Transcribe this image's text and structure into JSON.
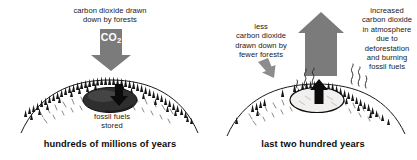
{
  "figure": {
    "title": "Carbon dioxide: forests vs. deforestation and fossil fuel burning",
    "colors": {
      "arrow_gray": "#7b7b7b",
      "ink_black": "#111111",
      "label_white": "#ffffff",
      "background": "#ffffff"
    }
  },
  "panels": [
    {
      "id": "left",
      "heading": "carbon dioxide drawn\ndown by forests",
      "arrow": {
        "icon": "thick-down-arrow-icon",
        "direction": "down",
        "label": "CO",
        "label_subscript": "2",
        "color": "#7b7b7b"
      },
      "deposit_label": "fossil fuels\nstored",
      "deposit_arrow": {
        "icon": "down-arrow-icon",
        "direction": "down",
        "color": "#111111"
      },
      "caption": "hundreds of millions of years",
      "scene": {
        "tree_count": 58,
        "tree_density": "dense",
        "deposit_fill": "dark",
        "smoke": false
      }
    },
    {
      "id": "right",
      "heading_left": "less\ncarbon dioxide\ndrawn down by\nfewer forests",
      "heading_right": "increased\ncarbon dioxide\nin atmosphere\ndue to\ndeforestation\nand burning\nfossil fuels",
      "arrow": {
        "icon": "thick-up-arrow-icon",
        "direction": "up",
        "label": "CO",
        "label_subscript": "2",
        "color": "#7b7b7b"
      },
      "small_arrow": {
        "icon": "small-down-arrow-icon",
        "direction": "down",
        "color": "#8c8c8c"
      },
      "deposit_arrow": {
        "icon": "up-arrow-icon",
        "direction": "up",
        "color": "#111111"
      },
      "caption": "last two hundred years",
      "scene": {
        "tree_count": 33,
        "tree_density": "sparse",
        "deposit_fill": "light",
        "smoke": true
      }
    }
  ]
}
